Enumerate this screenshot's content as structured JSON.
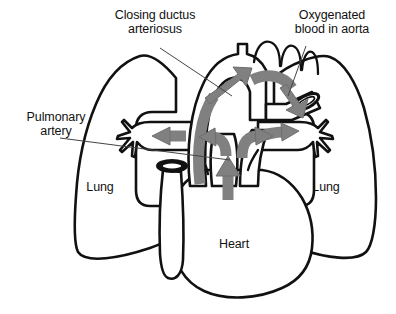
{
  "figure": {
    "colors": {
      "outline": "#111111",
      "arrow_gray": "#808080",
      "arrow_gray_edge": "#6e6e6e",
      "background": "#ffffff",
      "leader_line": "#444444",
      "vessel_fill": "#ffffff",
      "cross_section_dark": "#111111"
    }
  },
  "labels": {
    "closing_ductus": "Closing ductus\narteriosus",
    "oxygenated_blood": "Oxygenated\nblood in aorta",
    "pulmonary_artery": "Pulmonary\nartery",
    "lung_left": "Lung",
    "lung_right": "Lung",
    "heart": "Heart"
  },
  "anatomy": {
    "parts": [
      "left lung",
      "right lung",
      "heart",
      "aortic arch",
      "pulmonary artery",
      "ductus arteriosus",
      "aorta cross-section",
      "vena cava cross-section"
    ]
  },
  "flow_arrows": [
    {
      "name": "aortic-arch-flow",
      "direction": "up-and-over-right"
    },
    {
      "name": "descending-aorta-flow",
      "direction": "right-and-down"
    },
    {
      "name": "left-pulmonary-flow",
      "direction": "left"
    },
    {
      "name": "right-pulmonary-flow",
      "direction": "right"
    },
    {
      "name": "ventricle-outflow",
      "direction": "up"
    },
    {
      "name": "central-left-branch",
      "direction": "up-left"
    },
    {
      "name": "central-right-branch",
      "direction": "up-right"
    }
  ]
}
